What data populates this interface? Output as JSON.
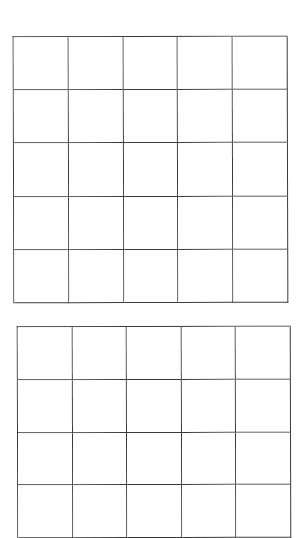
{
  "page": {
    "background": "#ffffff",
    "line_color": "#3a3a3a"
  },
  "top_fragment": {
    "text": ""
  },
  "grids": [
    {
      "id": "grid-1",
      "rows": 5,
      "columns": 5,
      "cells_filled": false,
      "cropped": false
    },
    {
      "id": "grid-2",
      "rows": 4,
      "columns": 5,
      "cells_filled": false,
      "cropped": true
    }
  ]
}
